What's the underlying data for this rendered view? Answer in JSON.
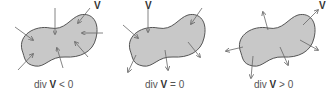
{
  "panels": [
    {
      "caption_prefix": "div ",
      "caption_symbol": "V",
      "caption_suffix": " < 0",
      "label": "V"
    },
    {
      "caption_prefix": "div ",
      "caption_symbol": "V",
      "caption_suffix": " = 0",
      "label": "V"
    },
    {
      "caption_prefix": "div ",
      "caption_symbol": "V",
      "caption_suffix": " > 0",
      "label": "V"
    }
  ],
  "colors": {
    "fill": "#c8c8c8",
    "stroke": "#555555",
    "arrow": "#666666"
  }
}
